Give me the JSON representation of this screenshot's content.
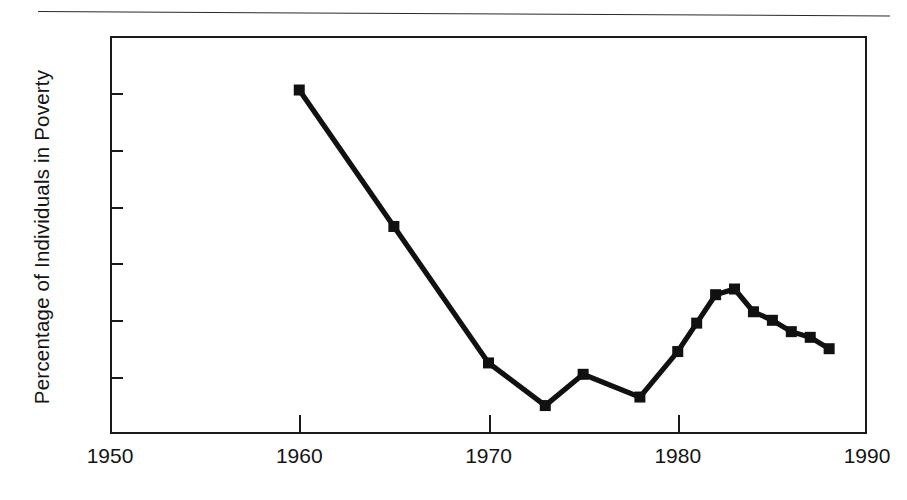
{
  "figure": {
    "has_top_rule": true,
    "background_color": "#ffffff",
    "ink_color": "#1a1a1a"
  },
  "chart_data": {
    "type": "line",
    "title": "",
    "xlabel": "",
    "ylabel": "Percentage of Individuals in Poverty",
    "xlim": [
      1950,
      1990
    ],
    "ylim": [
      10,
      24
    ],
    "xticks": [
      1950,
      1960,
      1970,
      1980,
      1990
    ],
    "xtick_labels": [
      "1950",
      "1960",
      "1970",
      "1980",
      "1990"
    ],
    "yticks": [
      10,
      12,
      14,
      16,
      18,
      20,
      22,
      24
    ],
    "ytick_labels": [
      "10",
      "12",
      "14",
      "16",
      "18",
      "20",
      "22",
      "24"
    ],
    "grid": false,
    "legend": false,
    "marker": "filled-square",
    "line_color": "#111111",
    "x": [
      1960,
      1965,
      1970,
      1973,
      1975,
      1978,
      1980,
      1981,
      1982,
      1983,
      1984,
      1985,
      1986,
      1987,
      1988
    ],
    "values": [
      22.1,
      17.3,
      12.5,
      11.0,
      12.1,
      11.3,
      12.9,
      13.9,
      14.9,
      15.1,
      14.3,
      14.0,
      13.6,
      13.4,
      13.0
    ],
    "series": [
      {
        "name": "Percentage of Individuals in Poverty",
        "points": [
          {
            "x": 1960,
            "y": 22.1
          },
          {
            "x": 1965,
            "y": 17.3
          },
          {
            "x": 1970,
            "y": 12.5
          },
          {
            "x": 1973,
            "y": 11.0
          },
          {
            "x": 1975,
            "y": 12.1
          },
          {
            "x": 1978,
            "y": 11.3
          },
          {
            "x": 1980,
            "y": 12.9
          },
          {
            "x": 1981,
            "y": 13.9
          },
          {
            "x": 1982,
            "y": 14.9
          },
          {
            "x": 1983,
            "y": 15.1
          },
          {
            "x": 1984,
            "y": 14.3
          },
          {
            "x": 1985,
            "y": 14.0
          },
          {
            "x": 1986,
            "y": 13.6
          },
          {
            "x": 1987,
            "y": 13.4
          },
          {
            "x": 1988,
            "y": 13.0
          }
        ]
      }
    ]
  }
}
